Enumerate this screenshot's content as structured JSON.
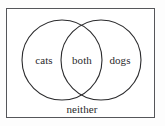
{
  "diagram": {
    "type": "venn-2-set",
    "title": "",
    "frame": {
      "border_color": "#55565a",
      "background_color": "#ffffff"
    },
    "stroke_color": "#2b2b2d",
    "text_color": "#2a2a2c",
    "sets": [
      {
        "id": "left",
        "label": "cats",
        "center_x": 62,
        "center_y": 60,
        "radius": 40
      },
      {
        "id": "right",
        "label": "dogs",
        "center_x": 101,
        "center_y": 60,
        "radius": 40
      }
    ],
    "regions": [
      {
        "id": "left-only",
        "label": "cats"
      },
      {
        "id": "intersection",
        "label": "both"
      },
      {
        "id": "right-only",
        "label": "dogs"
      },
      {
        "id": "outside",
        "label": "neither"
      }
    ],
    "labels": {
      "left_only": "cats",
      "intersection": "both",
      "right_only": "dogs",
      "outside": "neither"
    }
  }
}
